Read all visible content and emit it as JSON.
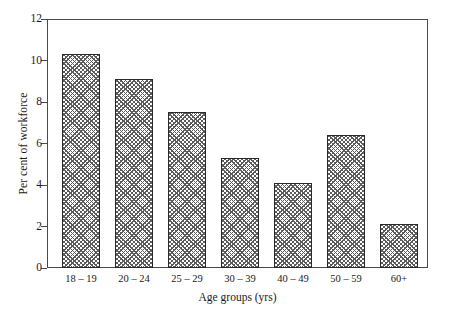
{
  "chart_data": {
    "type": "bar",
    "title": "",
    "subtitle": "",
    "xlabel": "Age groups (yrs)",
    "ylabel": "Per cent of workforce",
    "categories": [
      "18 – 19",
      "20 – 24",
      "25 – 29",
      "30 – 39",
      "40 – 49",
      "50 – 59",
      "60+"
    ],
    "values": [
      10.3,
      9.1,
      7.5,
      5.3,
      4.1,
      6.4,
      2.1
    ],
    "ylim": [
      0,
      12
    ],
    "ytick_labels": [
      "0",
      "2",
      "4",
      "6",
      "8",
      "10",
      "12"
    ],
    "ytick_values": [
      0,
      2,
      4,
      6,
      8,
      10,
      12
    ],
    "grid": false,
    "legend": false,
    "legend_position": "none",
    "bar_fill_pattern": "crosshatch",
    "bar_edge_color": "#2a2a2a",
    "bar_pattern_color": "#5c5c5c",
    "axis_color": "#4a4a4a",
    "background_color": "#ffffff"
  }
}
